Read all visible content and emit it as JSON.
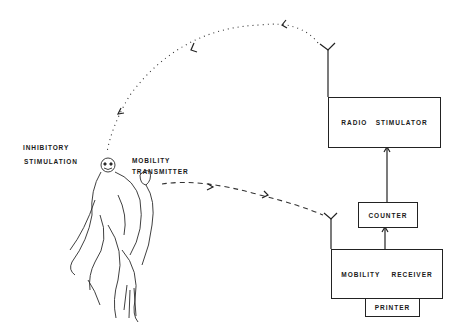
{
  "diagram": {
    "labels": {
      "inhibitory_line1": "INHIBITORY",
      "inhibitory_line2": "STIMULATION",
      "mobility_line1": "MOBILITY",
      "mobility_line2": "TRANSMITTER"
    },
    "boxes": {
      "radio_stimulator": "RADIO   STIMULATOR",
      "counter": "COUNTER",
      "mobility_receiver": "MOBILITY    RECEIVER",
      "printer": "PRINTER"
    },
    "figure": "monkey-sketch",
    "links": [
      {
        "from": "radio_stimulator",
        "to": "monkey",
        "style": "dotted",
        "meaning": "inhibitory stimulation radio signal"
      },
      {
        "from": "mobility_transmitter",
        "to": "mobility_receiver",
        "style": "dashed",
        "meaning": "mobility signal"
      },
      {
        "from": "mobility_receiver",
        "to": "counter",
        "style": "arrow"
      },
      {
        "from": "counter",
        "to": "radio_stimulator",
        "style": "arrow"
      },
      {
        "from": "mobility_receiver",
        "to": "printer",
        "style": "attached"
      }
    ]
  }
}
